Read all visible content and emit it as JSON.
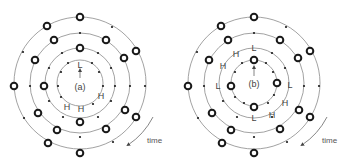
{
  "diagrams": [
    {
      "id": "a",
      "panel_label": "(a)",
      "center": [
        80,
        83
      ],
      "letters": [
        {
          "text": "L",
          "x": 80,
          "y": 66
        },
        {
          "text": "H",
          "x": 101,
          "y": 97
        },
        {
          "text": "H",
          "x": 67,
          "y": 107
        },
        {
          "text": "H",
          "x": 80,
          "y": 110
        }
      ],
      "time_label": "time"
    },
    {
      "id": "b",
      "panel_label": "(b)",
      "center": [
        254,
        83
      ],
      "letters": [
        {
          "text": "L",
          "x": 254,
          "y": 50
        },
        {
          "text": "H",
          "x": 235,
          "y": 55
        },
        {
          "text": "H",
          "x": 223,
          "y": 67
        },
        {
          "text": "L",
          "x": 218,
          "y": 87
        },
        {
          "text": "L",
          "x": 290,
          "y": 87
        },
        {
          "text": "H",
          "x": 285,
          "y": 104
        },
        {
          "text": "H",
          "x": 272,
          "y": 116
        },
        {
          "text": "L",
          "x": 254,
          "y": 119
        }
      ],
      "time_label": "time"
    }
  ],
  "colors": {
    "ring": "#8a8a8a",
    "marker": "#1a1a1a",
    "text": "#444444"
  }
}
